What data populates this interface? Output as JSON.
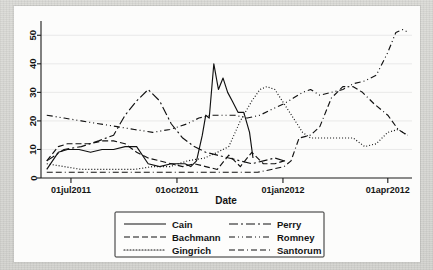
{
  "figure": {
    "title": "",
    "background_color": "#fcfcfb",
    "page_color": "#d9d9d6"
  },
  "axes": {
    "x_title": "Date",
    "y_title": "",
    "x_tick_labels": [
      "01jul2011",
      "01oct2011",
      "01jan2012",
      "01apr2012"
    ],
    "y_tick_labels": [
      "0",
      "10",
      "20",
      "30",
      "40",
      "50"
    ]
  },
  "legend": {
    "entries": [
      {
        "label": "Cain",
        "style": "solid",
        "column": "left"
      },
      {
        "label": "Bachmann",
        "style": "dashed",
        "column": "left"
      },
      {
        "label": "Gingrich",
        "style": "dotted",
        "column": "left"
      },
      {
        "label": "Perry",
        "style": "longdash-dot",
        "column": "right"
      },
      {
        "label": "Romney",
        "style": "dash-dot-dot",
        "column": "right"
      },
      {
        "label": "Santorum",
        "style": "dash-dash-dot",
        "column": "right"
      }
    ]
  },
  "chart_data": {
    "type": "line",
    "title": "",
    "xlabel": "Date",
    "ylabel": "",
    "xlim": [
      "2011-06-05",
      "2012-04-22"
    ],
    "ylim": [
      0,
      55
    ],
    "y_ticks": [
      0,
      10,
      20,
      30,
      40,
      50
    ],
    "x_ticks": [
      "01jul2011",
      "01oct2011",
      "01jan2012",
      "01apr2012"
    ],
    "grid": true,
    "legend_position": "below-axes",
    "x_unit": "date",
    "series": [
      {
        "name": "Cain",
        "style": "solid",
        "x": [
          "2011-06-10",
          "2011-06-20",
          "2011-06-28",
          "2011-07-08",
          "2011-07-18",
          "2011-07-28",
          "2011-08-07",
          "2011-08-17",
          "2011-08-27",
          "2011-09-06",
          "2011-09-16",
          "2011-09-26",
          "2011-10-03",
          "2011-10-08",
          "2011-10-13",
          "2011-10-18",
          "2011-10-23",
          "2011-10-26",
          "2011-10-29",
          "2011-11-02",
          "2011-11-06",
          "2011-11-10",
          "2011-11-14",
          "2011-11-18",
          "2011-11-23",
          "2011-11-28",
          "2011-12-03",
          "2011-12-06"
        ],
        "y": [
          3,
          9,
          10,
          10,
          9,
          10,
          10,
          11,
          11,
          5,
          4,
          5,
          5,
          5,
          4,
          6,
          15,
          22,
          21,
          40,
          31,
          35,
          30,
          27,
          23,
          23,
          16,
          7
        ]
      },
      {
        "name": "Bachmann",
        "style": "dashed",
        "x": [
          "2011-06-10",
          "2011-06-20",
          "2011-06-28",
          "2011-07-08",
          "2011-07-18",
          "2011-07-28",
          "2011-08-07",
          "2011-08-17",
          "2011-08-27",
          "2011-09-06",
          "2011-09-16",
          "2011-09-26",
          "2011-10-06",
          "2011-10-16",
          "2011-10-26",
          "2011-11-05",
          "2011-11-15",
          "2011-11-25",
          "2011-12-05",
          "2011-12-15",
          "2011-12-25",
          "2012-01-02",
          "2012-01-05"
        ],
        "y": [
          6,
          11,
          12,
          12,
          12,
          13,
          13,
          12,
          9,
          7,
          6,
          5,
          4,
          5,
          4,
          3,
          8,
          4,
          9,
          5,
          5,
          6,
          6
        ]
      },
      {
        "name": "Gingrich",
        "style": "dotted",
        "x": [
          "2011-06-10",
          "2011-06-25",
          "2011-07-10",
          "2011-07-25",
          "2011-08-10",
          "2011-08-25",
          "2011-09-10",
          "2011-09-25",
          "2011-10-10",
          "2011-10-25",
          "2011-11-05",
          "2011-11-15",
          "2011-11-25",
          "2011-12-05",
          "2011-12-12",
          "2011-12-18",
          "2011-12-25",
          "2012-01-02",
          "2012-01-10",
          "2012-01-18",
          "2012-01-25",
          "2012-02-02",
          "2012-02-12",
          "2012-02-22",
          "2012-03-02",
          "2012-03-12",
          "2012-03-22",
          "2012-04-01",
          "2012-04-10",
          "2012-04-18"
        ],
        "y": [
          5,
          4,
          3,
          3,
          3,
          3,
          4,
          4,
          6,
          7,
          9,
          11,
          20,
          27,
          31,
          32,
          31,
          26,
          21,
          16,
          14,
          14,
          14,
          14,
          14,
          11,
          12,
          16,
          17,
          15
        ]
      },
      {
        "name": "Perry",
        "style": "longdash-dot",
        "x": [
          "2011-06-10",
          "2011-06-25",
          "2011-07-10",
          "2011-07-25",
          "2011-08-07",
          "2011-08-17",
          "2011-08-27",
          "2011-09-06",
          "2011-09-16",
          "2011-09-26",
          "2011-10-06",
          "2011-10-16",
          "2011-10-26",
          "2011-11-05",
          "2011-11-15",
          "2011-11-25",
          "2011-12-05",
          "2011-12-15",
          "2011-12-25",
          "2012-01-02"
        ],
        "y": [
          6,
          10,
          11,
          13,
          15,
          22,
          27,
          31,
          27,
          19,
          14,
          11,
          9,
          8,
          7,
          6,
          5,
          6,
          7,
          6
        ]
      },
      {
        "name": "Romney",
        "style": "dash-dot-dot",
        "x": [
          "2011-06-10",
          "2011-06-25",
          "2011-07-10",
          "2011-07-25",
          "2011-08-10",
          "2011-08-25",
          "2011-09-10",
          "2011-09-25",
          "2011-10-10",
          "2011-10-20",
          "2011-10-30",
          "2011-11-10",
          "2011-11-20",
          "2011-12-01",
          "2011-12-12",
          "2011-12-22",
          "2012-01-02",
          "2012-01-10",
          "2012-01-18",
          "2012-01-25",
          "2012-02-02",
          "2012-02-12",
          "2012-02-22",
          "2012-03-02",
          "2012-03-12",
          "2012-03-22",
          "2012-04-01",
          "2012-04-08",
          "2012-04-14",
          "2012-04-19"
        ],
        "y": [
          22,
          21,
          20,
          19,
          18,
          17,
          16,
          17,
          19,
          21,
          22,
          22,
          22,
          21,
          22,
          24,
          26,
          28,
          30,
          31,
          29,
          30,
          31,
          33,
          34,
          36,
          44,
          51,
          52,
          51
        ]
      },
      {
        "name": "Santorum",
        "style": "dash-dash-dot",
        "x": [
          "2011-06-10",
          "2011-06-25",
          "2011-07-10",
          "2011-07-25",
          "2011-08-10",
          "2011-08-25",
          "2011-09-10",
          "2011-09-25",
          "2011-10-10",
          "2011-10-25",
          "2011-11-10",
          "2011-11-25",
          "2011-12-10",
          "2011-12-22",
          "2012-01-02",
          "2012-01-08",
          "2012-01-15",
          "2012-01-25",
          "2012-02-02",
          "2012-02-12",
          "2012-02-22",
          "2012-03-02",
          "2012-03-10",
          "2012-03-20",
          "2012-04-01",
          "2012-04-10",
          "2012-04-18"
        ],
        "y": [
          2,
          2,
          2,
          2,
          2,
          2,
          2,
          2,
          2,
          2,
          2,
          2,
          2,
          3,
          4,
          6,
          14,
          15,
          18,
          28,
          32,
          32,
          30,
          26,
          22,
          17,
          15
        ]
      }
    ]
  }
}
